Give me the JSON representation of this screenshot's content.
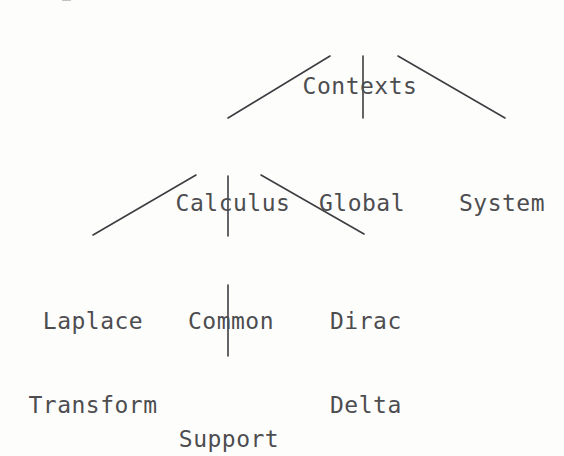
{
  "diagram": {
    "title": "Contexts",
    "type": "tree",
    "background_color": "#fdfdfc",
    "text_color": "#4d4d50",
    "edge_color": "#3e3e42",
    "nodes": {
      "root": {
        "label": "Contexts"
      },
      "calculus": {
        "label": "Calculus"
      },
      "global": {
        "label": "Global"
      },
      "system": {
        "label": "System"
      },
      "laplace_line1": {
        "label": "Laplace"
      },
      "laplace_line2": {
        "label": "Transform"
      },
      "common": {
        "label": "Common"
      },
      "dirac_line1": {
        "label": "Dirac"
      },
      "dirac_line2": {
        "label": "Delta"
      },
      "support": {
        "label": "Support"
      }
    },
    "edges": [
      {
        "from": "Contexts",
        "to": "Calculus"
      },
      {
        "from": "Contexts",
        "to": "Global"
      },
      {
        "from": "Contexts",
        "to": "System"
      },
      {
        "from": "Calculus",
        "to": "Laplace Transform"
      },
      {
        "from": "Calculus",
        "to": "Common"
      },
      {
        "from": "Calculus",
        "to": "Dirac Delta"
      },
      {
        "from": "Common",
        "to": "Support"
      }
    ]
  }
}
